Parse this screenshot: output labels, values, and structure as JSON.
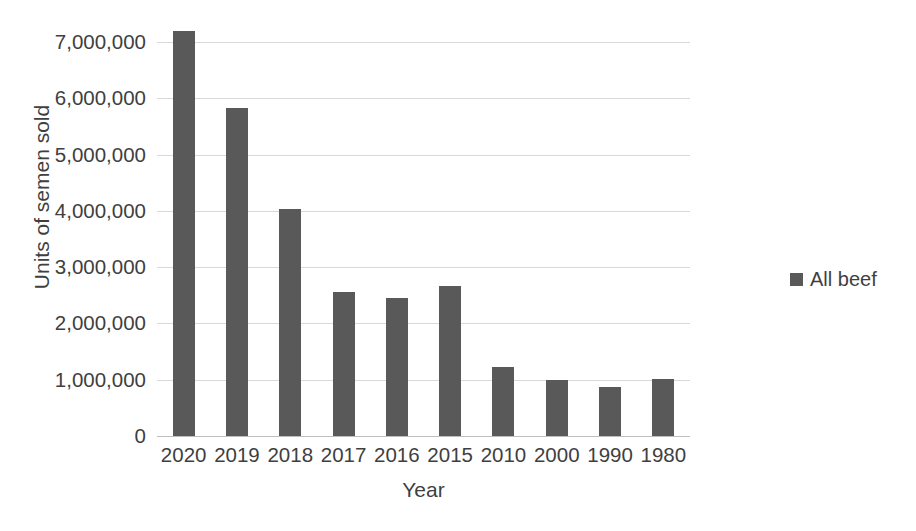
{
  "chart_data": {
    "type": "bar",
    "title": "",
    "xlabel": "Year",
    "ylabel": "Units of semen sold",
    "categories": [
      "2020",
      "2019",
      "2018",
      "2017",
      "2016",
      "2015",
      "2010",
      "2000",
      "1990",
      "1980"
    ],
    "series": [
      {
        "name": "All beef",
        "color": "#595959",
        "values": [
          7190000,
          5830000,
          4030000,
          2550000,
          2450000,
          2660000,
          1230000,
          990000,
          870000,
          1020000
        ]
      }
    ],
    "ylim": [
      0,
      7500000
    ],
    "ytick_values": [
      0,
      1000000,
      2000000,
      3000000,
      4000000,
      5000000,
      6000000,
      7000000
    ],
    "ytick_labels": [
      "0",
      "1,000,000",
      "2,000,000",
      "3,000,000",
      "4,000,000",
      "5,000,000",
      "6,000,000",
      "7,000,000"
    ],
    "grid": true,
    "gridline_color": "#d9d9d9",
    "legend_position": "right",
    "legend_entries": [
      "All beef"
    ]
  },
  "legend": {
    "items": [
      {
        "label": "All beef",
        "color": "#595959"
      }
    ]
  },
  "axes": {
    "y_title": "Units of semen sold",
    "x_title": "Year"
  },
  "caption": {
    "cut_off_text": ""
  }
}
